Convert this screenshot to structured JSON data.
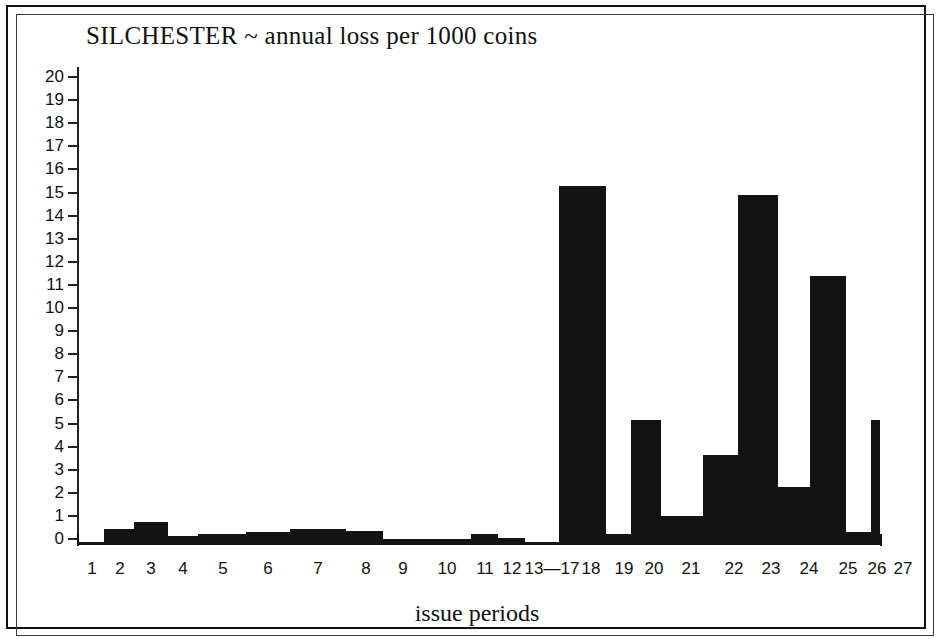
{
  "figure": {
    "title": "SILCHESTER ~ annual loss per 1000 coins",
    "xaxis_title": "issue periods",
    "frame": "printed-border"
  },
  "chart_data": {
    "type": "bar",
    "title": "SILCHESTER ~ annual loss per 1000 coins",
    "xlabel": "issue periods",
    "ylabel": "",
    "ylim": [
      0,
      20
    ],
    "grid": false,
    "legend": "none",
    "bar_style": "contiguous black histogram bars, no gaps",
    "y_ticks": [
      0,
      1,
      2,
      3,
      4,
      5,
      6,
      7,
      8,
      9,
      10,
      11,
      12,
      13,
      14,
      15,
      16,
      17,
      18,
      19,
      20
    ],
    "y_tick_labels": [
      "0",
      "1",
      "2",
      "3",
      "4",
      "5",
      "6",
      "7",
      "8",
      "9",
      "10",
      "11",
      "12",
      "13",
      "14",
      "15",
      "16",
      "17",
      "18",
      "19",
      "20"
    ],
    "categories": [
      "1",
      "2",
      "3",
      "4",
      "5",
      "6",
      "7",
      "8",
      "9",
      "10",
      "11",
      "12",
      "13—17",
      "18",
      "19",
      "20",
      "21",
      "22",
      "23",
      "24",
      "25",
      "26",
      "27"
    ],
    "values": [
      0.1,
      0.65,
      0.95,
      0.35,
      0.45,
      0.5,
      0.65,
      0.55,
      0.2,
      0.2,
      0.45,
      0.25,
      0.1,
      15.5,
      0.45,
      5.35,
      1.2,
      3.85,
      15.1,
      2.45,
      11.6,
      0.5,
      5.35
    ],
    "bars": [
      {
        "label": "1",
        "value": 0.1,
        "x0": 0,
        "x1": 25.5
      },
      {
        "label": "2",
        "value": 0.65,
        "x0": 25.5,
        "x1": 55.5
      },
      {
        "label": "3",
        "value": 0.95,
        "x0": 55.5,
        "x1": 90.0
      },
      {
        "label": "4",
        "value": 0.35,
        "x0": 90.0,
        "x1": 120.0
      },
      {
        "label": "5",
        "value": 0.45,
        "x0": 120.0,
        "x1": 168.0
      },
      {
        "label": "6",
        "value": 0.5,
        "x0": 168.0,
        "x1": 212.0
      },
      {
        "label": "7",
        "value": 0.65,
        "x0": 212.0,
        "x1": 268.0
      },
      {
        "label": "8",
        "value": 0.55,
        "x0": 268.0,
        "x1": 305.0
      },
      {
        "label": "9",
        "value": 0.2,
        "x0": 305.0,
        "x1": 345.0
      },
      {
        "label": "10",
        "value": 0.2,
        "x0": 345.0,
        "x1": 393.0
      },
      {
        "label": "11",
        "value": 0.45,
        "x0": 393.0,
        "x1": 420.0
      },
      {
        "label": "12",
        "value": 0.25,
        "x0": 420.0,
        "x1": 447.0
      },
      {
        "label": "13—17",
        "value": 0.1,
        "x0": 447.0,
        "x1": 481.0
      },
      {
        "label": "18",
        "value": 15.5,
        "x0": 481.0,
        "x1": 528.0
      },
      {
        "label": "19",
        "value": 0.45,
        "x0": 528.0,
        "x1": 553.0
      },
      {
        "label": "20",
        "value": 5.35,
        "x0": 553.0,
        "x1": 583.0
      },
      {
        "label": "21",
        "value": 1.2,
        "x0": 583.0,
        "x1": 625.0
      },
      {
        "label": "22",
        "value": 3.85,
        "x0": 625.0,
        "x1": 660.0
      },
      {
        "label": "23",
        "value": 15.1,
        "x0": 660.0,
        "x1": 700.0
      },
      {
        "label": "24",
        "value": 2.45,
        "x0": 700.0,
        "x1": 732.0
      },
      {
        "label": "25",
        "value": 11.6,
        "x0": 732.0,
        "x1": 768.0
      },
      {
        "label": "26",
        "value": 0.5,
        "x0": 768.0,
        "x1": 793.0
      },
      {
        "label": "27",
        "value": 5.35,
        "x0": 793.0,
        "x1": 802.0
      }
    ],
    "tick_label_positions": [
      {
        "label": "1",
        "center": 14
      },
      {
        "label": "2",
        "center": 42
      },
      {
        "label": "3",
        "center": 73
      },
      {
        "label": "4",
        "center": 105
      },
      {
        "label": "5",
        "center": 145
      },
      {
        "label": "6",
        "center": 190
      },
      {
        "label": "7",
        "center": 240
      },
      {
        "label": "8",
        "center": 288
      },
      {
        "label": "9",
        "center": 325
      },
      {
        "label": "10",
        "center": 369
      },
      {
        "label": "11",
        "center": 407
      },
      {
        "label": "12",
        "center": 434
      },
      {
        "label": "13—17",
        "center": 474
      },
      {
        "label": "18",
        "center": 513
      },
      {
        "label": "19",
        "center": 546
      },
      {
        "label": "20",
        "center": 576
      },
      {
        "label": "21",
        "center": 613
      },
      {
        "label": "22",
        "center": 656
      },
      {
        "label": "23",
        "center": 693
      },
      {
        "label": "24",
        "center": 731
      },
      {
        "label": "25",
        "center": 770
      },
      {
        "label": "26",
        "center": 799
      },
      {
        "label": "27",
        "center": 825
      }
    ],
    "colors": {
      "bar": "#131313",
      "axis": "#111111",
      "background": "#ffffff",
      "text": "#111111"
    }
  }
}
